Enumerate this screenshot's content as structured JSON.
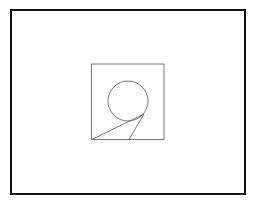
{
  "diagram": {
    "colors": {
      "background": "#ffffff",
      "frame": "#111111",
      "stroke": "#555555"
    },
    "outer_frame": {
      "x": 11,
      "y": 10,
      "width": 234,
      "height": 184,
      "stroke_width": 2
    },
    "inner_square": {
      "x": 91.5,
      "y": 64,
      "width": 72.5,
      "height": 75.5
    },
    "circle": {
      "cx": 128,
      "cy": 101,
      "r": 20
    },
    "lines": [
      {
        "x1": 92,
        "y1": 139.5,
        "x2": 144,
        "y2": 114
      },
      {
        "x1": 129,
        "y1": 139.5,
        "x2": 144,
        "y2": 114
      }
    ]
  }
}
